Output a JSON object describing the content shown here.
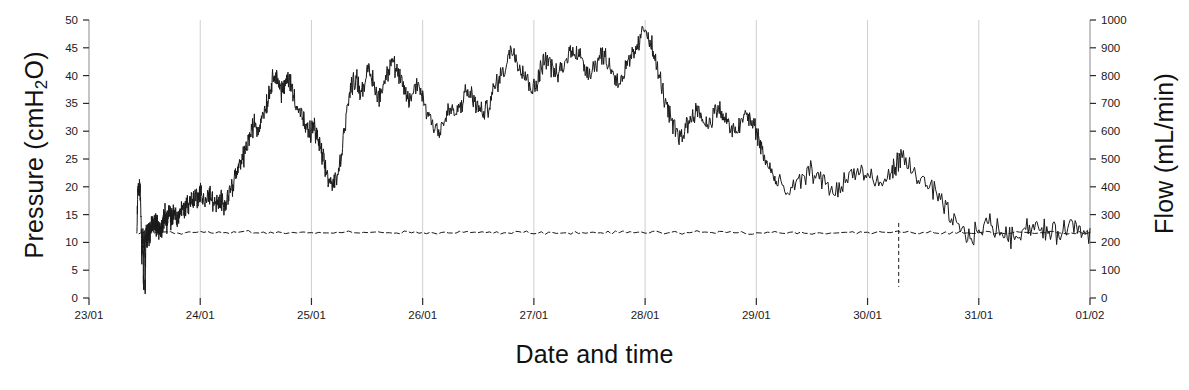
{
  "chart_data": {
    "type": "line",
    "title": "",
    "xlabel": "Date and time",
    "ylabel": "Pressure (cmH2O)",
    "y2label": "Flow (mL/min)",
    "grid": true,
    "grid_axis": "x",
    "legend": "none",
    "background": "#ffffff",
    "line_color": "#1a1a1a",
    "grid_color": "#cfcfcf",
    "axis_color": "#8a8a8a",
    "xlim": [
      "23/01",
      "01/02"
    ],
    "x_tick_labels": [
      "23/01",
      "24/01",
      "25/01",
      "26/01",
      "27/01",
      "28/01",
      "29/01",
      "30/01",
      "31/01",
      "01/02"
    ],
    "x_tick_days": [
      0,
      1,
      2,
      3,
      4,
      5,
      6,
      7,
      8,
      9
    ],
    "ylim": [
      0,
      50
    ],
    "y_tick_labels": [
      "0",
      "5",
      "10",
      "15",
      "20",
      "25",
      "30",
      "35",
      "40",
      "45",
      "50"
    ],
    "y_ticks": [
      0,
      5,
      10,
      15,
      20,
      25,
      30,
      35,
      40,
      45,
      50
    ],
    "y2lim": [
      0,
      1000
    ],
    "y2_tick_labels": [
      "0",
      "100",
      "200",
      "300",
      "400",
      "500",
      "600",
      "700",
      "800",
      "900",
      "1000"
    ],
    "y2_ticks": [
      0,
      100,
      200,
      300,
      400,
      500,
      600,
      700,
      800,
      900,
      1000
    ],
    "series": [
      {
        "name": "Pressure",
        "axis": "left",
        "units": "cmH2O",
        "style": "solid",
        "x_days": [
          0.43,
          0.44,
          0.45,
          0.455,
          0.46,
          0.47,
          0.475,
          0.48,
          0.485,
          0.49,
          0.495,
          0.5,
          0.505,
          0.51,
          0.515,
          0.52,
          0.525,
          0.53,
          0.535,
          0.54,
          0.545,
          0.55,
          0.56,
          0.57,
          0.58,
          0.59,
          0.6,
          0.61,
          0.62,
          0.63,
          0.64,
          0.65,
          0.66,
          0.67,
          0.68,
          0.69,
          0.7,
          0.71,
          0.72,
          0.73,
          0.74,
          0.75,
          0.76,
          0.78,
          0.8,
          0.82,
          0.84,
          0.86,
          0.88,
          0.9,
          0.92,
          0.94,
          0.96,
          0.98,
          1.0,
          1.02,
          1.05,
          1.08,
          1.1,
          1.13,
          1.16,
          1.19,
          1.22,
          1.25,
          1.28,
          1.31,
          1.34,
          1.37,
          1.4,
          1.43,
          1.46,
          1.49,
          1.52,
          1.55,
          1.58,
          1.61,
          1.64,
          1.67,
          1.7,
          1.73,
          1.76,
          1.79,
          1.82,
          1.85,
          1.88,
          1.91,
          1.94,
          1.97,
          2.0,
          2.02,
          2.05,
          2.08,
          2.1,
          2.13,
          2.16,
          2.2,
          2.24,
          2.28,
          2.32,
          2.36,
          2.4,
          2.44,
          2.48,
          2.52,
          2.56,
          2.6,
          2.64,
          2.68,
          2.72,
          2.76,
          2.8,
          2.84,
          2.88,
          2.92,
          2.96,
          3.0,
          3.05,
          3.1,
          3.15,
          3.2,
          3.25,
          3.3,
          3.35,
          3.4,
          3.45,
          3.5,
          3.55,
          3.6,
          3.65,
          3.7,
          3.75,
          3.8,
          3.85,
          3.9,
          3.95,
          4.0,
          4.03,
          4.06,
          4.1,
          4.15,
          4.2,
          4.25,
          4.3,
          4.35,
          4.4,
          4.45,
          4.5,
          4.55,
          4.6,
          4.65,
          4.7,
          4.75,
          4.8,
          4.85,
          4.9,
          4.95,
          5.0,
          5.05,
          5.1,
          5.15,
          5.2,
          5.25,
          5.3,
          5.35,
          5.4,
          5.45,
          5.5,
          5.55,
          5.6,
          5.65,
          5.7,
          5.75,
          5.8,
          5.85,
          5.9,
          5.95,
          6.0,
          6.03,
          6.06,
          6.1,
          6.15,
          6.2,
          6.3,
          6.4,
          6.5,
          6.6,
          6.7,
          6.8,
          6.9,
          7.0,
          7.1,
          7.2,
          7.25,
          7.3,
          7.4,
          7.5,
          7.6,
          7.7,
          7.8,
          7.9,
          8.0,
          8.1,
          8.2,
          8.3,
          8.4,
          8.5,
          8.6,
          8.7,
          8.8,
          8.9,
          9.0
        ],
        "y_values": [
          12.0,
          20.0,
          19.0,
          20.4,
          19.2,
          12.5,
          6.0,
          11.0,
          10.5,
          2.5,
          11.5,
          9.0,
          0.5,
          10.5,
          11.5,
          11.3,
          10.8,
          11.6,
          12.0,
          11.5,
          12.0,
          11.8,
          12.6,
          13.5,
          12.5,
          14.2,
          13.8,
          12.8,
          13.2,
          12.2,
          11.8,
          12.5,
          13.0,
          13.8,
          15.0,
          14.5,
          13.8,
          14.5,
          15.5,
          14.8,
          14.0,
          14.5,
          15.2,
          15.0,
          14.5,
          15.5,
          16.2,
          16.0,
          17.0,
          16.8,
          18.0,
          17.5,
          18.5,
          18.0,
          19.0,
          18.2,
          17.5,
          18.5,
          18.0,
          17.0,
          16.5,
          17.5,
          17.0,
          18.5,
          20.0,
          21.5,
          23.0,
          24.5,
          26.0,
          28.0,
          30.0,
          31.5,
          30.0,
          32.5,
          34.0,
          36.0,
          38.5,
          41.0,
          39.0,
          37.0,
          38.0,
          40.0,
          38.0,
          36.0,
          34.0,
          33.0,
          31.0,
          29.5,
          30.0,
          31.0,
          29.0,
          27.0,
          25.0,
          23.0,
          21.0,
          20.5,
          22.0,
          28.0,
          34.0,
          38.0,
          40.0,
          37.0,
          39.0,
          41.0,
          38.5,
          36.0,
          38.0,
          40.5,
          43.0,
          41.0,
          39.0,
          37.0,
          35.5,
          37.0,
          39.0,
          36.0,
          33.0,
          31.5,
          30.0,
          32.0,
          34.0,
          33.0,
          35.0,
          37.0,
          36.0,
          34.0,
          33.0,
          35.0,
          38.0,
          40.0,
          42.0,
          45.0,
          43.0,
          41.0,
          39.0,
          37.5,
          39.0,
          41.0,
          43.5,
          42.0,
          40.0,
          41.0,
          43.0,
          45.0,
          44.0,
          42.0,
          40.5,
          42.0,
          44.0,
          43.0,
          41.0,
          39.0,
          40.0,
          42.0,
          44.0,
          46.0,
          49.0,
          46.0,
          42.0,
          38.0,
          34.0,
          31.0,
          29.0,
          30.0,
          32.0,
          34.0,
          33.0,
          31.0,
          32.5,
          34.0,
          33.0,
          31.0,
          29.5,
          31.0,
          33.0,
          32.0,
          30.0,
          28.0,
          26.0,
          24.0,
          22.0,
          20.0,
          19.0,
          21.0,
          23.0,
          21.0,
          19.0,
          21.0,
          23.0,
          22.0,
          20.0,
          22.0,
          24.0,
          25.0,
          23.0,
          21.0,
          19.0,
          16.0,
          13.0,
          11.0,
          12.0,
          13.5,
          12.0,
          11.0,
          12.5,
          13.0,
          12.0,
          11.5,
          13.0,
          12.5,
          11.5,
          12.0,
          13.0,
          12.5,
          12.0,
          13.0,
          12.0,
          12.5
        ]
      },
      {
        "name": "Flow",
        "axis": "right",
        "units": "mL/min",
        "style": "dashed",
        "approx_level_mL_min": 235,
        "x_days": [
          0.45,
          0.6,
          0.8,
          1.0,
          1.2,
          1.4,
          1.6,
          1.8,
          2.0,
          2.2,
          2.4,
          2.6,
          2.8,
          3.0,
          3.2,
          3.4,
          3.6,
          3.8,
          4.0,
          4.2,
          4.4,
          4.6,
          4.8,
          5.0,
          5.2,
          5.4,
          5.6,
          5.8,
          6.0,
          6.2,
          6.4,
          6.6,
          6.8,
          7.0,
          7.2,
          7.4,
          7.6,
          7.8,
          8.0,
          8.2,
          8.4,
          8.6,
          8.8,
          9.0
        ],
        "y_values": [
          235,
          238,
          233,
          236,
          234,
          237,
          235,
          233,
          236,
          234,
          237,
          235,
          236,
          234,
          235,
          237,
          234,
          236,
          235,
          233,
          236,
          234,
          237,
          235,
          234,
          236,
          235,
          237,
          234,
          236,
          235,
          234,
          236,
          235,
          237,
          234,
          236,
          235,
          234,
          236,
          235,
          237,
          234,
          236
        ]
      }
    ],
    "annotations": [
      {
        "text": "data dropout spike",
        "x_day": 7.28,
        "y_value": 2.0
      }
    ]
  },
  "labels": {
    "y_left_title_prefix": "Pressure (cmH",
    "y_left_title_sub": "2",
    "y_left_title_suffix": "O)",
    "y_right_title": "Flow (mL/min)",
    "x_title": "Date and time"
  }
}
